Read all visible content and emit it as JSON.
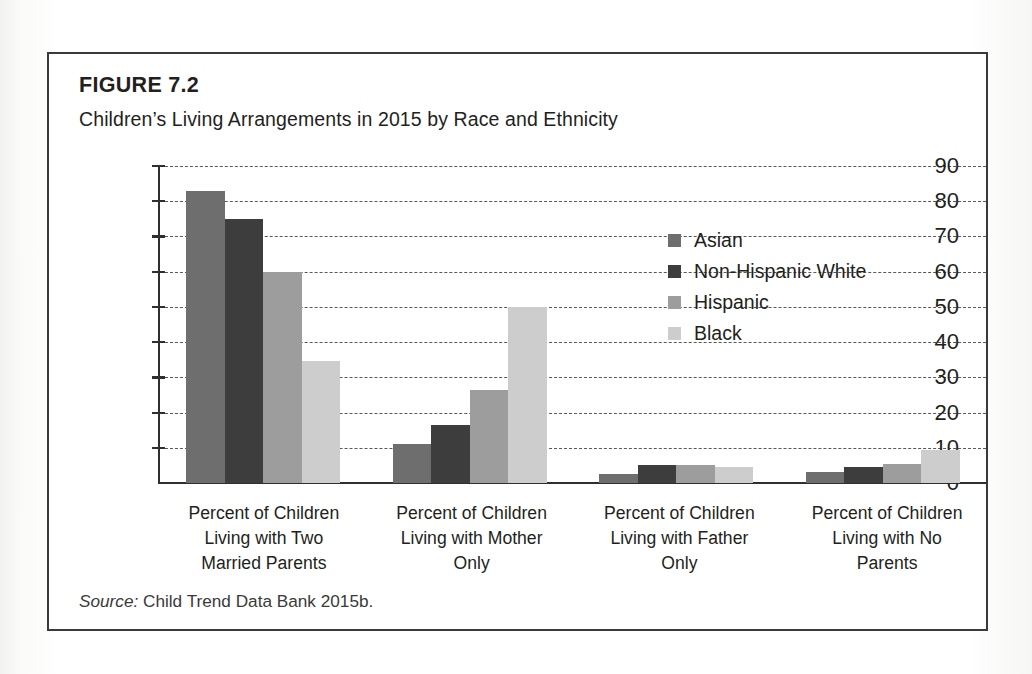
{
  "figure": {
    "label": "FIGURE 7.2",
    "title": "Children’s Living Arrangements in 2015 by Race and Ethnicity",
    "source_prefix": "Source:",
    "source_text": "Child Trend Data Bank 2015b."
  },
  "colors": {
    "asian": "#6e6e6e",
    "non_hispanic_white": "#3d3d3d",
    "hispanic": "#9d9d9d",
    "black": "#cdcdcd",
    "axis": "#2f2f2f",
    "gridline": "#58595b",
    "frame": "#3a3a3a",
    "text": "#231f20"
  },
  "chart_data": {
    "type": "bar",
    "title": "Children’s Living Arrangements in 2015 by Race and Ethnicity",
    "xlabel": "",
    "ylabel": "",
    "ylim": [
      0,
      90
    ],
    "yticks": [
      0,
      10,
      20,
      30,
      40,
      50,
      60,
      70,
      80,
      90
    ],
    "ytick_labels": [
      "0",
      "10",
      "20",
      "30",
      "40",
      "50",
      "60",
      "70",
      "80",
      "90"
    ],
    "grid": true,
    "grid_style": "dashed horizontal",
    "legend_position": "inside upper right",
    "categories": [
      "Percent of Children Living with Two Married Parents",
      "Percent of Children Living with Mother Only",
      "Percent of Children Living with Father Only",
      "Percent of Children Living with No Parents"
    ],
    "category_label_lines": [
      [
        "Percent of Children",
        "Living with Two",
        "Married Parents"
      ],
      [
        "Percent of Children",
        "Living with Mother",
        "Only"
      ],
      [
        "Percent of Children",
        "Living with Father",
        "Only"
      ],
      [
        "Percent of Children",
        "Living with No",
        "Parents"
      ]
    ],
    "series": [
      {
        "name": "Asian",
        "color": "#6e6e6e",
        "values": [
          83,
          11,
          2.5,
          3
        ]
      },
      {
        "name": "Non-Hispanic White",
        "color": "#3d3d3d",
        "values": [
          75,
          16.5,
          5,
          4.5
        ]
      },
      {
        "name": "Hispanic",
        "color": "#9d9d9d",
        "values": [
          60,
          26.5,
          5,
          5.5
        ]
      },
      {
        "name": "Black",
        "color": "#cdcdcd",
        "values": [
          34.5,
          50,
          4.5,
          9.5
        ]
      }
    ]
  }
}
